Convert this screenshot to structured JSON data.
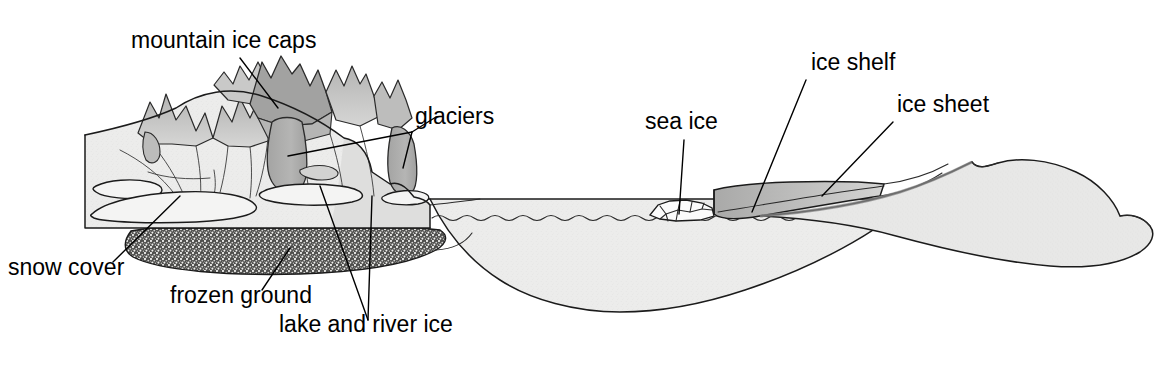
{
  "figure": {
    "type": "diagram",
    "background_color": "#ffffff",
    "width": 1166,
    "height": 378
  },
  "labels": [
    {
      "id": "mountain-ice-caps",
      "text": "mountain ice caps",
      "x": 131,
      "y": 48,
      "anchor": "start"
    },
    {
      "id": "glaciers",
      "text": "glaciers",
      "x": 415,
      "y": 124,
      "anchor": "start"
    },
    {
      "id": "snow-cover",
      "text": "snow cover",
      "x": 8,
      "y": 275,
      "anchor": "start"
    },
    {
      "id": "frozen-ground",
      "text": "frozen ground",
      "x": 170,
      "y": 303,
      "anchor": "start"
    },
    {
      "id": "lake-and-river-ice",
      "text": "lake and river ice",
      "x": 279,
      "y": 332,
      "anchor": "start"
    },
    {
      "id": "sea-ice",
      "text": "sea ice",
      "x": 645,
      "y": 129,
      "anchor": "start"
    },
    {
      "id": "ice-shelf",
      "text": "ice shelf",
      "x": 811,
      "y": 70,
      "anchor": "start"
    },
    {
      "id": "ice-sheet",
      "text": "ice sheet",
      "x": 897,
      "y": 112,
      "anchor": "start"
    }
  ],
  "palette": {
    "outline": "#1b1b1b",
    "snow_light": "#ececeb",
    "mountain_face": "#e3e3e2",
    "mountain_shadow": "#b9b9b8",
    "peak_shadow": "#a8a8a7",
    "glacier_gray": "#adadac",
    "ice_cap_gray": "#9c9c9b",
    "frozen_ground": "#4a4a48",
    "ocean_fill": "#ececeb",
    "ice_shelf": "#bdbdbc",
    "ice_sheet": "#e6e6e5",
    "sea_ice_fill": "#fbfbfb",
    "label_text": "#000000"
  },
  "components": [
    {
      "id": "mountain-block",
      "name": "mountain massif with ice caps and glaciers",
      "region": "left"
    },
    {
      "id": "snow-cover-lobes",
      "name": "snow cover lobes on lower slopes",
      "region": "left"
    },
    {
      "id": "frozen-ground-layer",
      "name": "stippled permafrost layer beneath mountain block",
      "region": "left"
    },
    {
      "id": "ocean-basin",
      "name": "ocean basin with sea surface and water body",
      "region": "center"
    },
    {
      "id": "sea-ice-floes",
      "name": "angular sea ice floes floating at sea surface",
      "region": "center-right"
    },
    {
      "id": "ice-shelf-wedge",
      "name": "floating ice shelf wedge with calving front",
      "region": "right"
    },
    {
      "id": "ice-sheet-dome",
      "name": "grounded ice sheet dome",
      "region": "far-right"
    }
  ]
}
